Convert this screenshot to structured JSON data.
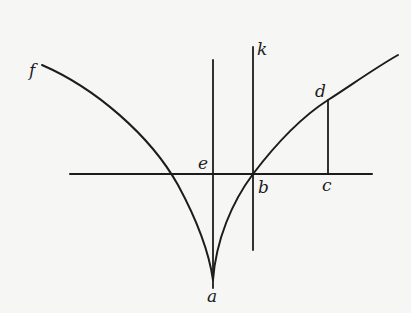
{
  "diagram": {
    "type": "geometric-construction",
    "colors": {
      "background": "#f6f6f4",
      "ink": "#1c1c1c"
    },
    "labels": {
      "f": "f",
      "k": "k",
      "d": "d",
      "e": "e",
      "b": "b",
      "c": "c",
      "a": "a"
    },
    "points": {
      "a": {
        "x": 213,
        "y": 280
      },
      "b": {
        "x": 253,
        "y": 174
      },
      "c": {
        "x": 328,
        "y": 174
      },
      "d": {
        "x": 328,
        "y": 100
      },
      "e": {
        "x": 213,
        "y": 174
      },
      "f": {
        "x": 42,
        "y": 65
      },
      "k": {
        "x": 253,
        "y": 47
      }
    },
    "lines": [
      {
        "name": "horizontal-axis",
        "from": [
          70,
          174
        ],
        "to": [
          372,
          174
        ]
      },
      {
        "name": "vertical-line-ea",
        "from": [
          213,
          60
        ],
        "to": [
          213,
          288
        ]
      },
      {
        "name": "vertical-line-kb",
        "from": [
          253,
          47
        ],
        "to": [
          253,
          250
        ]
      },
      {
        "name": "ordinate-dc",
        "from": [
          328,
          100
        ],
        "to": [
          328,
          174
        ]
      }
    ],
    "curves": [
      {
        "name": "left-curve-fa",
        "from": "f",
        "to": "a"
      },
      {
        "name": "right-curve-ad",
        "from": "a",
        "through": [
          "b",
          "d"
        ],
        "to": [
          398,
          55
        ]
      }
    ]
  }
}
